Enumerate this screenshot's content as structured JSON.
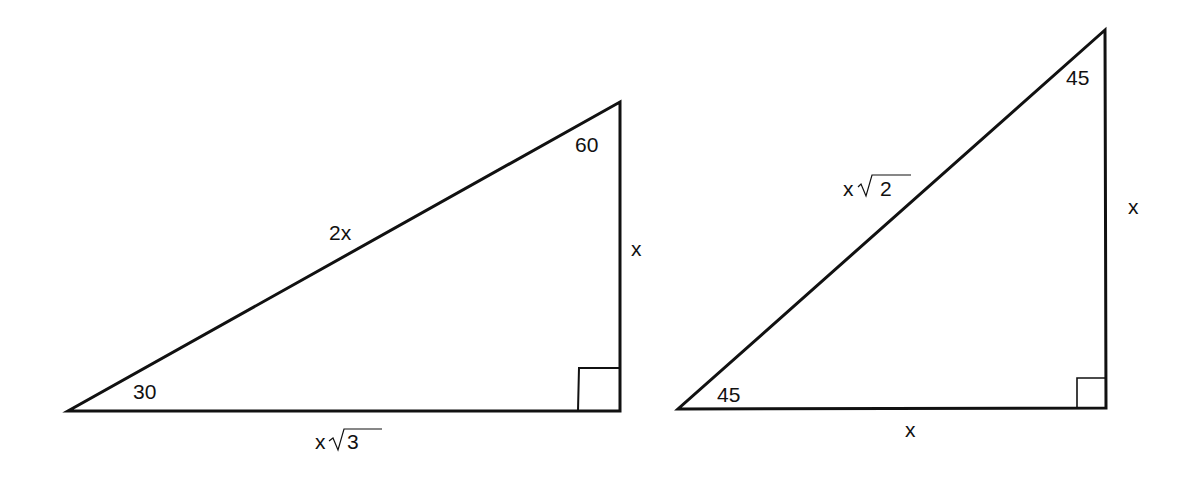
{
  "diagram": {
    "triangles": [
      {
        "id": "30-60-90",
        "angles": {
          "bottom_left": "30",
          "top_right": "60",
          "right_angle": "90"
        },
        "sides": {
          "hypotenuse": "2x",
          "vertical_leg": "x",
          "base_prefix": "x",
          "base_radicand": "3"
        }
      },
      {
        "id": "45-45-90",
        "angles": {
          "bottom_left": "45",
          "top_right": "45",
          "right_angle": "90"
        },
        "sides": {
          "hypotenuse_prefix": "x",
          "hypotenuse_radicand": "2",
          "vertical_leg": "x",
          "base": "x"
        }
      }
    ],
    "colors": {
      "stroke": "#111111",
      "background": "#ffffff"
    }
  }
}
